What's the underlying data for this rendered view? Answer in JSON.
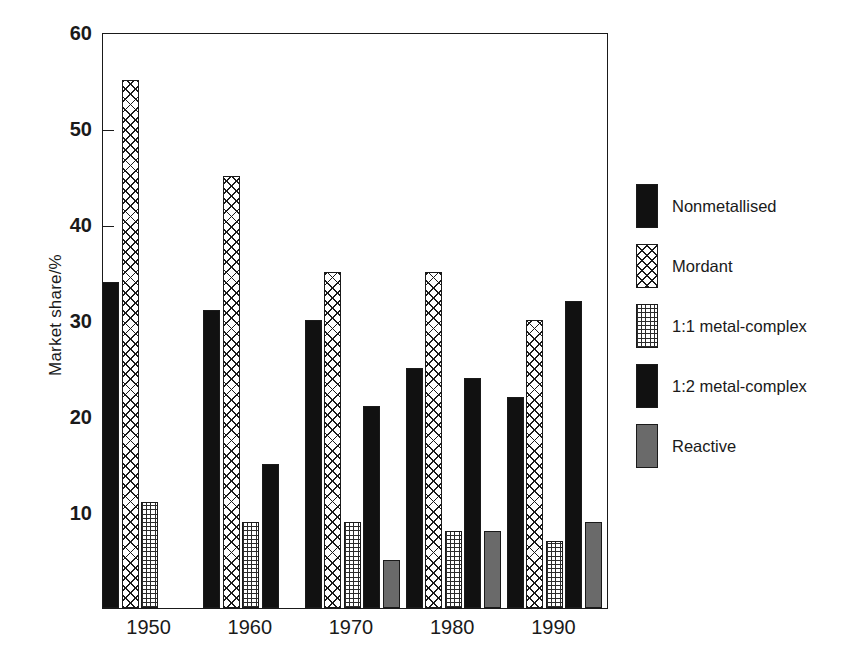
{
  "chart_data": {
    "type": "bar",
    "title": "",
    "subtitle": "",
    "xlabel": "",
    "ylabel": "Market share/%",
    "categories": [
      "1950",
      "1960",
      "1970",
      "1980",
      "1990"
    ],
    "ylim": [
      0,
      60
    ],
    "yticks": [
      10,
      20,
      30,
      40,
      50,
      60
    ],
    "ytick_labels": [
      "10",
      "20",
      "30",
      "40",
      "50",
      "60"
    ],
    "grid": false,
    "legend_position": "right",
    "series": [
      {
        "name": "Nonmetallised",
        "pattern": "solid-black",
        "color": "#111111",
        "values": [
          34,
          31,
          30,
          25,
          22
        ]
      },
      {
        "name": "Mordant",
        "pattern": "crosshatch",
        "color": "#ffffff",
        "values": [
          55,
          45,
          35,
          35,
          30
        ]
      },
      {
        "name": "1:1 metal-complex",
        "pattern": "grid",
        "color": "#ffffff",
        "values": [
          11,
          9,
          9,
          8,
          7
        ]
      },
      {
        "name": "1:2 metal-complex",
        "pattern": "solid-black",
        "color": "#111111",
        "values": [
          null,
          15,
          21,
          24,
          32
        ]
      },
      {
        "name": "Reactive",
        "pattern": "gray",
        "color": "#6a6a6a",
        "values": [
          null,
          null,
          5,
          8,
          9
        ]
      }
    ]
  },
  "legend": {
    "items": [
      {
        "label": "Nonmetallised",
        "pattern": "solid-black"
      },
      {
        "label": "Mordant",
        "pattern": "crosshatch"
      },
      {
        "label": "1:1 metal-complex",
        "pattern": "grid"
      },
      {
        "label": "1:2 metal-complex",
        "pattern": "solid-black"
      },
      {
        "label": "Reactive",
        "pattern": "gray"
      }
    ]
  },
  "axes": {
    "y_title": "Market share/%",
    "frame_color": "#1a1a1a"
  }
}
